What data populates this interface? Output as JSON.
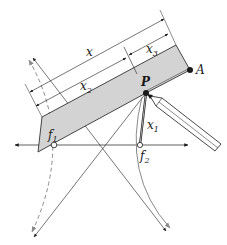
{
  "diagram": {
    "title": "",
    "labels": {
      "x": "x",
      "x2": "x",
      "x2_sub": "2",
      "x3": "x",
      "x3_sub": "3",
      "x1": "x",
      "x1_sub": "1",
      "P": "P",
      "A": "A",
      "f1": "f",
      "f1_sub": "1",
      "f2": "f",
      "f2_sub": "2"
    },
    "points": {
      "P": [
        146,
        93
      ],
      "A": [
        190,
        70
      ],
      "f1": [
        54,
        145
      ],
      "f2": [
        140,
        145
      ]
    },
    "colors": {
      "ruler_fill": "#d3d3d3",
      "line": "#1a1a1a",
      "gray_line": "#8a8a8a"
    }
  }
}
